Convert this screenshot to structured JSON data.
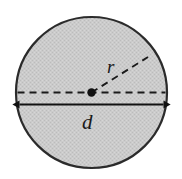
{
  "figure": {
    "name": "circle-radius-diameter-diagram",
    "background_color": "#ffffff",
    "width": 182,
    "height": 179
  },
  "circle": {
    "name": "shaded-circle",
    "center_x": 91.5,
    "center_y": 92.5,
    "radius": 75.5,
    "fill_color": "#c9c9c9",
    "stroke_color": "#2b2b2b",
    "stroke_width": 2.2,
    "texture": "dithered-halftone-gray"
  },
  "center_point": {
    "name": "center-dot",
    "x": 91.5,
    "y": 92.5,
    "radius": 4.2,
    "color": "#111111"
  },
  "diameter_dashed_line": {
    "name": "diameter-dashed-line",
    "x1": 17.5,
    "y1": 92.5,
    "x2": 165.5,
    "y2": 92.5,
    "color": "#1a1a1a",
    "dash": "7 5",
    "width": 1.9
  },
  "radius_dashed_line": {
    "name": "radius-dashed-line",
    "x1": 91.5,
    "y1": 92.5,
    "x2": 148.0,
    "y2": 57.0,
    "color": "#1a1a1a",
    "dash": "7 5",
    "width": 1.9
  },
  "diameter_arrow": {
    "name": "diameter-arrow",
    "x1": 17.0,
    "y1": 104.5,
    "x2": 166.0,
    "y2": 104.5,
    "color": "#111111",
    "width": 2.0,
    "arrowhead": "double-ended"
  },
  "labels": {
    "radius": {
      "name": "radius-label",
      "text": "r",
      "x": 107.0,
      "y": 73.0,
      "style": "italic-serif"
    },
    "diameter": {
      "name": "diameter-label",
      "text": "d",
      "x": 82.0,
      "y": 129.0,
      "style": "italic-serif"
    }
  },
  "colors": {
    "fill": "#c9c9c9",
    "stroke": "#2b2b2b",
    "line": "#1a1a1a",
    "label": "#1a1a1a",
    "background": "#ffffff"
  }
}
